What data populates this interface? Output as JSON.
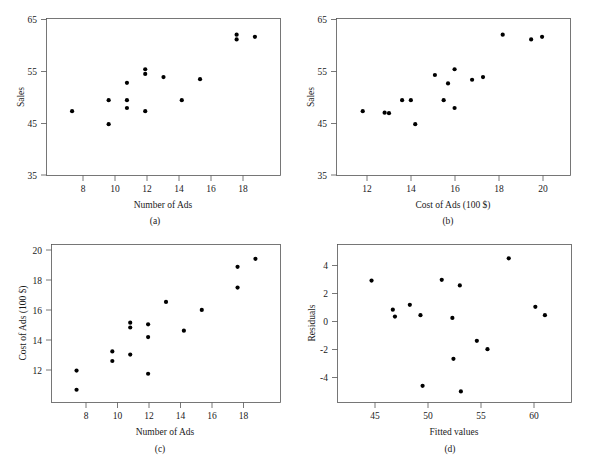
{
  "figure": {
    "background": "#ffffff",
    "point_color": "#000000",
    "axis_color": "#555555",
    "panel_count": 4
  },
  "chart_data": [
    {
      "type": "scatter",
      "panel": "a",
      "caption": "(a)",
      "title": "",
      "xlabel": "Number of Ads",
      "ylabel": "Sales",
      "xlim": [
        6.6,
        19.4
      ],
      "ylim": [
        35,
        65
      ],
      "xticks": [
        8,
        10,
        12,
        14,
        16,
        18
      ],
      "yticks": [
        35,
        45,
        55,
        65
      ],
      "grid": false,
      "legend": "none",
      "x": [
        8,
        10,
        10,
        11,
        11,
        11,
        12,
        12,
        12,
        13,
        14,
        15,
        17,
        17,
        18
      ],
      "y": [
        47.3,
        44.8,
        49.4,
        52.7,
        49.4,
        47.9,
        55.3,
        54.4,
        47.3,
        53.8,
        49.4,
        53.4,
        61.9,
        61.0,
        61.5
      ]
    },
    {
      "type": "scatter",
      "panel": "b",
      "caption": "(b)",
      "title": "",
      "xlabel": "Cost of Ads (100 $)",
      "ylabel": "Sales",
      "xlim": [
        10.6,
        21.3
      ],
      "ylim": [
        35,
        65
      ],
      "xticks": [
        12,
        14,
        16,
        18,
        20
      ],
      "yticks": [
        35,
        45,
        55,
        65
      ],
      "grid": false,
      "legend": "none",
      "x": [
        11.8,
        12.8,
        13.0,
        13.6,
        14.0,
        14.2,
        15.1,
        15.5,
        15.7,
        16.0,
        16.0,
        16.8,
        17.3,
        18.2,
        19.5,
        20.0
      ],
      "y": [
        47.3,
        47.0,
        46.9,
        49.4,
        49.4,
        44.8,
        54.2,
        49.4,
        52.6,
        55.3,
        47.9,
        53.3,
        53.8,
        61.9,
        61.0,
        61.5
      ]
    },
    {
      "type": "scatter",
      "panel": "c",
      "caption": "(c)",
      "title": "",
      "xlabel": "Number of Ads",
      "ylabel": "Cost of Ads (100 $)",
      "xlim": [
        6.6,
        19.4
      ],
      "ylim": [
        11.0,
        20.9
      ],
      "xticks": [
        8,
        10,
        12,
        14,
        16,
        18
      ],
      "yticks": [
        12,
        14,
        16,
        18,
        20
      ],
      "grid": false,
      "legend": "none",
      "x": [
        8,
        8,
        10,
        10,
        11,
        11,
        11,
        12,
        12,
        12,
        13,
        14,
        15,
        17,
        17,
        18
      ],
      "y": [
        13.0,
        11.8,
        14.2,
        13.6,
        16.0,
        15.7,
        14.0,
        15.9,
        15.1,
        12.8,
        17.3,
        15.5,
        16.8,
        19.5,
        18.2,
        20.0
      ]
    },
    {
      "type": "scatter",
      "panel": "d",
      "caption": "(d)",
      "title": "",
      "xlabel": "Fitted values",
      "ylabel": "Residuals",
      "xlim": [
        41.5,
        63.5
      ],
      "ylim": [
        -6.0,
        5.4
      ],
      "xticks": [
        45,
        50,
        55,
        60
      ],
      "yticks": [
        -4,
        -2,
        0,
        2,
        4
      ],
      "grid": false,
      "legend": "none",
      "x": [
        44.7,
        46.7,
        46.9,
        48.3,
        49.3,
        49.5,
        51.3,
        52.3,
        52.4,
        53.0,
        53.1,
        54.6,
        55.6,
        57.6,
        60.1,
        61.0
      ],
      "y": [
        2.8,
        0.7,
        0.2,
        1.05,
        0.3,
        -4.8,
        2.85,
        0.1,
        -2.85,
        2.45,
        -5.2,
        -1.55,
        -2.15,
        4.4,
        0.9,
        0.3
      ]
    }
  ]
}
